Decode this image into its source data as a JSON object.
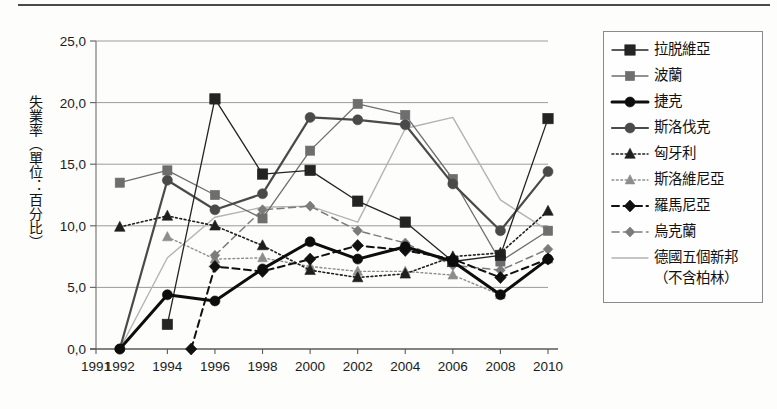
{
  "figure": {
    "has_top_rule": true,
    "background": "#fdfdfc"
  },
  "axis": {
    "ylabel": "失業率（單位：百分比）",
    "ytick_labels": [
      "25,0",
      "20,0",
      "15,0",
      "10,0",
      "5,0",
      "0,0"
    ],
    "ytick_values": [
      25,
      20,
      15,
      10,
      5,
      0
    ],
    "xtick_labels": [
      "1991",
      "1992",
      "1994",
      "1996",
      "1998",
      "2000",
      "2002",
      "2004",
      "2006",
      "2008",
      "2010"
    ]
  },
  "legend": {
    "entries": [
      {
        "label": "拉脱維亞",
        "marker": "square",
        "color": "#242424",
        "width": 1.3,
        "dash": "none",
        "size": 5.2
      },
      {
        "label": "波蘭",
        "marker": "square",
        "color": "#6e6e6e",
        "width": 1.3,
        "dash": "none",
        "size": 4.6
      },
      {
        "label": "捷克",
        "marker": "circle",
        "color": "#0d0d0d",
        "width": 3.0,
        "dash": "none",
        "size": 5.0
      },
      {
        "label": "斯洛伐克",
        "marker": "circle",
        "color": "#4a4a4a",
        "width": 2.2,
        "dash": "none",
        "size": 5.0
      },
      {
        "label": "匈牙利",
        "marker": "triangle",
        "color": "#1f1f1f",
        "width": 1.6,
        "dash": "dot",
        "size": 5.0
      },
      {
        "label": "斯洛維尼亞",
        "marker": "triangle",
        "color": "#8d8d8d",
        "width": 1.4,
        "dash": "dot",
        "size": 4.6
      },
      {
        "label": "羅馬尼亞",
        "marker": "diamond",
        "color": "#111111",
        "width": 2.0,
        "dash": "dash",
        "size": 5.0
      },
      {
        "label": "烏克蘭",
        "marker": "diamond",
        "color": "#7b7b7b",
        "width": 1.5,
        "dash": "dash",
        "size": 4.2
      },
      {
        "label": "德國五個新邦",
        "label_line2": "（不含柏林）",
        "marker": "none",
        "color": "#b3b3b3",
        "width": 1.4,
        "dash": "none",
        "size": 0
      }
    ]
  },
  "chart_data": {
    "type": "line",
    "title": "",
    "xlabel": "",
    "ylabel": "失業率（單位：百分比）",
    "xlim": [
      1991,
      2010
    ],
    "ylim": [
      0,
      25
    ],
    "grid": true,
    "legend_position": "right",
    "x": [
      1992,
      1994,
      1996,
      1998,
      2000,
      2002,
      2004,
      2006,
      2008,
      2010
    ],
    "series": [
      {
        "name": "拉脱維亞",
        "x": [
          1994,
          1996,
          1998,
          2000,
          2002,
          2004,
          2006,
          2008,
          2010
        ],
        "values": [
          2.0,
          20.3,
          14.2,
          14.5,
          12.0,
          10.3,
          7.1,
          7.6,
          18.7
        ]
      },
      {
        "name": "波蘭",
        "x": [
          1992,
          1994,
          1996,
          1998,
          2000,
          2002,
          2004,
          2006,
          2008,
          2010
        ],
        "values": [
          13.5,
          14.5,
          12.5,
          10.6,
          16.1,
          19.9,
          19.0,
          13.8,
          7.1,
          9.6
        ]
      },
      {
        "name": "捷克",
        "x": [
          1992,
          1994,
          1996,
          1998,
          2000,
          2002,
          2004,
          2006,
          2008,
          2010
        ],
        "values": [
          0.0,
          4.4,
          3.9,
          6.5,
          8.7,
          7.3,
          8.3,
          7.1,
          4.4,
          7.3
        ]
      },
      {
        "name": "斯洛伐克",
        "x": [
          1992,
          1994,
          1996,
          1998,
          2000,
          2002,
          2004,
          2006,
          2008,
          2010
        ],
        "values": [
          0.0,
          13.7,
          11.3,
          12.6,
          18.8,
          18.6,
          18.2,
          13.4,
          9.6,
          14.4
        ]
      },
      {
        "name": "匈牙利",
        "x": [
          1992,
          1994,
          1996,
          1998,
          2000,
          2002,
          2004,
          2006,
          2008,
          2010
        ],
        "values": [
          9.9,
          10.8,
          10.0,
          8.4,
          6.4,
          5.8,
          6.1,
          7.5,
          7.8,
          11.2
        ]
      },
      {
        "name": "斯洛維尼亞",
        "x": [
          1994,
          1996,
          1998,
          2000,
          2002,
          2004,
          2006,
          2008,
          2010
        ],
        "values": [
          9.1,
          7.3,
          7.4,
          6.7,
          6.3,
          6.3,
          6.0,
          4.4,
          7.3
        ]
      },
      {
        "name": "羅馬尼亞",
        "x": [
          1995,
          1996,
          1998,
          2000,
          2002,
          2004,
          2006,
          2008,
          2010
        ],
        "values": [
          0.0,
          6.7,
          6.3,
          7.3,
          8.4,
          8.0,
          7.3,
          5.8,
          7.3
        ]
      },
      {
        "name": "烏克蘭",
        "x": [
          1996,
          1998,
          2000,
          2002,
          2004,
          2006,
          2008,
          2010
        ],
        "values": [
          7.6,
          11.3,
          11.6,
          9.6,
          8.6,
          6.8,
          6.4,
          8.1
        ]
      },
      {
        "name": "德國五個新邦（不含柏林）",
        "x": [
          1992,
          1994,
          1996,
          1998,
          2000,
          2002,
          2004,
          2006,
          2008,
          2010
        ],
        "values": [
          0.0,
          7.4,
          10.7,
          11.5,
          11.6,
          10.3,
          17.9,
          18.8,
          12.1,
          9.6
        ]
      }
    ]
  }
}
